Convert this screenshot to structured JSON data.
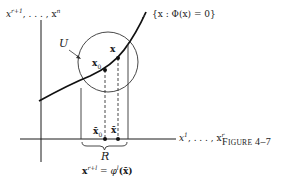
{
  "figure": {
    "caption_first": "F",
    "caption_rest": "igure",
    "caption_number": "4–7"
  },
  "labels": {
    "vertical_axis": "x^{r+1}, . . . , x^n",
    "vertical_axis_base": "x",
    "vertical_axis_sup1": "r+1",
    "vertical_axis_mid": ", . . . , x",
    "vertical_axis_sup2": "n",
    "horizontal_axis_base": "x",
    "horizontal_axis_sup1": "1",
    "horizontal_axis_mid": ", . . . , x",
    "horizontal_axis_sup2": "r",
    "surface": "{x : Φ(x) = 0}",
    "neighborhood": "U",
    "point_x0": "x",
    "point_x0_sub": "0",
    "point_x": "x",
    "proj_x0": "x̄",
    "proj_x0_sub": "0",
    "proj_x": "x̄",
    "region": "R",
    "equation_lhs": "x",
    "equation_sup": "r+l",
    "equation_mid": " = φ",
    "equation_sup2": "l",
    "equation_rhs": "(x̄)"
  },
  "diagram": {
    "stroke_color": "#1a1a1a",
    "vertical_axis": {
      "x": 41,
      "y1": 20,
      "y2": 162
    },
    "horizontal_axis": {
      "y": 139,
      "x1": 20,
      "x2": 176
    },
    "circle": {
      "cx": 108,
      "cy": 62,
      "r": 30
    },
    "region_bounds": {
      "x_left": 81,
      "x_right": 128
    },
    "point_x0": {
      "x": 105,
      "y": 70
    },
    "point_x": {
      "x": 118,
      "y": 58
    }
  }
}
